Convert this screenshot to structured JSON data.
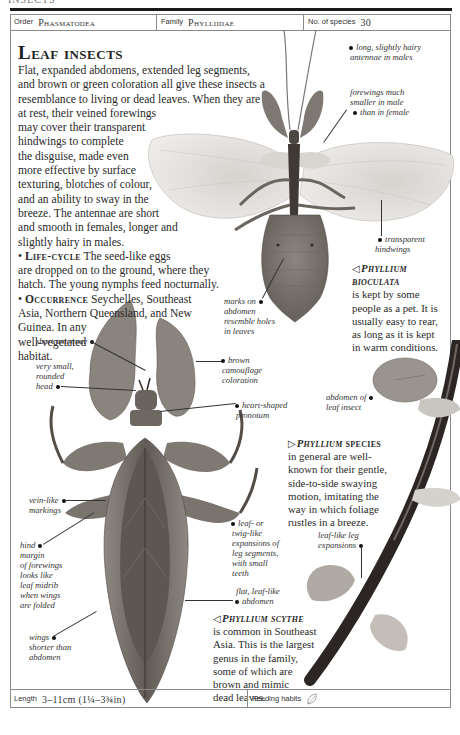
{
  "header": {
    "running_head": "INSECTS",
    "order_label": "Order",
    "order_value": "Phasmatodea",
    "family_label": "Family",
    "family_value": "Phylliidae",
    "species_label": "No. of species",
    "species_value": "30"
  },
  "article": {
    "title": "Leaf insects",
    "intro_lines": [
      "Flat, expanded abdomens, extended leg segments,",
      "and brown or green coloration all give these insects a",
      "resemblance to living or dead leaves. When they are",
      "at rest, their veined forewings",
      "may cover their transparent",
      "hindwings to complete",
      "the disguise, made even",
      "more effective by surface",
      "texturing, blotches of colour,",
      "and an ability to sway in the",
      "breeze. The antennae are short",
      "and smooth in females, longer and",
      "slightly hairy in males."
    ],
    "lifecycle_head": "Life-cycle",
    "lifecycle_lines": [
      " The seed-like eggs",
      "are dropped on to the ground, where they",
      "hatch. The young nymphs feed nocturnally."
    ],
    "occurrence_head": "Occurrence",
    "occurrence_lines": [
      " Seychelles, Southeast",
      "Asia, Northern Queensland, and New",
      "Guinea. In any",
      "well-vegetated",
      "habitat."
    ]
  },
  "labels": {
    "male_antennae": [
      "long, slightly hairy",
      "antennae in males"
    ],
    "male_forewings": [
      "forewings much",
      "smaller in male",
      "than in female"
    ],
    "transparent_hindwings": [
      "transparent",
      "hindwings"
    ],
    "abdomen_marks": [
      "marks on",
      "abdomen",
      "resemble holes",
      "in leaves"
    ],
    "short_antennae": [
      "short antennae"
    ],
    "small_head": [
      "very small,",
      "rounded",
      "head"
    ],
    "brown_camouflage": [
      "brown",
      "camouflage",
      "coloration"
    ],
    "heart_pronotum": [
      "heart-shaped",
      "pronotum"
    ],
    "vein_markings": [
      "vein-like",
      "markings"
    ],
    "hind_margin": [
      "hind",
      "margin",
      "of forewings",
      "looks like",
      "leaf midrib",
      "when wings",
      "are folded"
    ],
    "wings_shorter": [
      "wings",
      "shorter than",
      "abdomen"
    ],
    "leg_expansions": [
      "leaf- or",
      "twig-like",
      "expansions of",
      "leg segments,",
      "with small",
      "teeth"
    ],
    "flat_abdomen": [
      "flat, leaf-like",
      "abdomen"
    ],
    "abdomen_leaf_insect": [
      "abdomen of",
      "leaf insect"
    ],
    "leaf_leg_expansions": [
      "leaf-like leg",
      "expansions"
    ]
  },
  "captions": {
    "bioculata": {
      "pointer": "◁",
      "head_lines": [
        "Phyllium",
        "bioculata"
      ],
      "lines": [
        "is kept by some",
        "people as a pet. It is",
        "usually easy to rear,",
        "as long as it is kept",
        "in warm conditions."
      ]
    },
    "species": {
      "pointer": "▷",
      "head_italic": "Phyllium",
      "head_rest": " species",
      "lines": [
        "in general are well-",
        "known for their gentle,",
        "side-to-side swaying",
        "motion, imitating the",
        "way in which foliage",
        "rustles in a breeze."
      ]
    },
    "scythe": {
      "pointer": "◁",
      "head": "Phyllium scythe",
      "lines": [
        "is common in Southeast",
        "Asia. This is the largest",
        "genus in the family,",
        "some of which are",
        "brown and mimic",
        "dead leaves."
      ]
    }
  },
  "footer": {
    "length_label": "Length",
    "length_value": "3–11cm (1¼–3¾in)",
    "feeding_label": "Feeding habits",
    "feeding_icon": "leaf-icon"
  },
  "colors": {
    "rule": "#1a1a1a",
    "border": "#8a8a8a",
    "insect_dark": "#5a5450",
    "insect_mid": "#8a837d",
    "wing": "#e6e4e1",
    "stem": "#2b2624"
  }
}
